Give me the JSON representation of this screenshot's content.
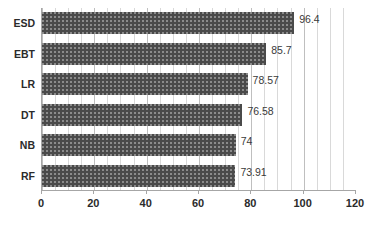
{
  "chart_data": {
    "type": "bar",
    "orientation": "horizontal",
    "title": "",
    "subtitle": "",
    "xlabel": "",
    "ylabel": "",
    "categories": [
      "ESD",
      "EBT",
      "LR",
      "DT",
      "NB",
      "RF"
    ],
    "values": [
      96.4,
      85.7,
      78.57,
      76.58,
      74,
      73.91
    ],
    "data_labels": [
      "96.4",
      "85.7",
      "78.57",
      "76.58",
      "74",
      "73.91"
    ],
    "xlim": [
      0,
      120
    ],
    "xticks": [
      0,
      20,
      40,
      60,
      80,
      100,
      120
    ],
    "xtick_labels": [
      "0",
      "20",
      "40",
      "60",
      "80",
      "100",
      "120"
    ],
    "minor_tick_interval": 5,
    "grid": true,
    "grid_axis": "x",
    "legend": false,
    "legend_position": "none",
    "series": [
      {
        "name": "",
        "values": [
          96.4,
          85.7,
          78.57,
          76.58,
          74,
          73.91
        ]
      }
    ]
  },
  "style": {
    "bar_color": "#4a4a4a",
    "grid_color": "#d9d9d9",
    "grid_major_color": "#bfbfbf",
    "axis_color": "#a6a6a6",
    "label_color": "#2b2b2b",
    "value_color": "#3a3a3a",
    "background": "#ffffff"
  }
}
